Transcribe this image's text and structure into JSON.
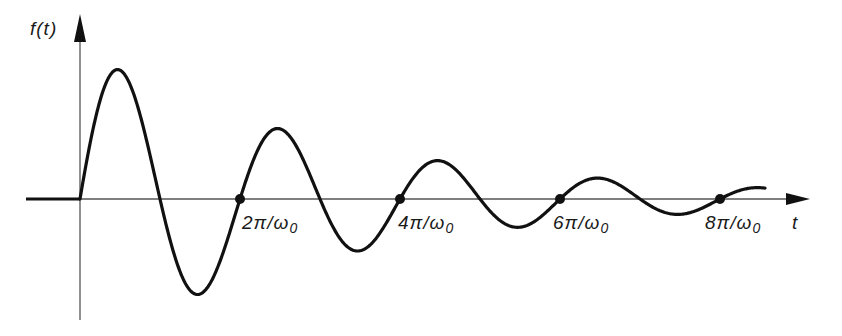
{
  "diagram": {
    "type": "damped-oscillation-plot",
    "y_axis_label": "f(t)",
    "x_axis_label": "t",
    "marked_points": [
      {
        "label_main": "2π/ω",
        "label_sub": "0"
      },
      {
        "label_main": "4π/ω",
        "label_sub": "0"
      },
      {
        "label_main": "6π/ω",
        "label_sub": "0"
      },
      {
        "label_main": "8π/ω",
        "label_sub": "0"
      }
    ],
    "colors": {
      "curve": "#111111",
      "axes": "#555555",
      "text": "#1a1a1a",
      "background": "#ffffff"
    }
  }
}
